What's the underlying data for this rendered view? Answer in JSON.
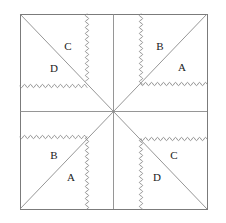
{
  "figure": {
    "canvas": {
      "width": 226,
      "height": 223,
      "background": "#ffffff"
    },
    "square": {
      "name": "outer-square",
      "left": 20,
      "top": 14,
      "right": 207,
      "bottom": 209,
      "stroke": "#7b7b7b",
      "stroke_width": 1
    },
    "center_point": {
      "x": 113.5,
      "y": 111.5
    },
    "straight_lines": [
      {
        "name": "diagonal-top-left-to-bottom-right",
        "x1": 20,
        "y1": 14,
        "x2": 207,
        "y2": 209,
        "stroke": "#8a8a8a"
      },
      {
        "name": "diagonal-bottom-left-to-top-right",
        "x1": 20,
        "y1": 209,
        "x2": 207,
        "y2": 14,
        "stroke": "#8a8a8a"
      },
      {
        "name": "vertical-median",
        "x1": 113.5,
        "y1": 14,
        "x2": 113.5,
        "y2": 209,
        "stroke": "#8a8a8a"
      },
      {
        "name": "horizontal-median",
        "x1": 20,
        "y1": 111.5,
        "x2": 207,
        "y2": 111.5,
        "stroke": "#8a8a8a"
      }
    ],
    "wavy_lines": [
      {
        "name": "wavy-vertical-top-left",
        "orientation": "vertical",
        "x1": 87,
        "y1": 14,
        "x2": 87,
        "y2": 81,
        "amplitude": 1.6,
        "wavelength": 6,
        "stroke": "#8a8a8a"
      },
      {
        "name": "wavy-horizontal-top-left",
        "orientation": "horizontal",
        "x1": 20,
        "y1": 86,
        "x2": 87,
        "y2": 86,
        "amplitude": 1.6,
        "wavelength": 6,
        "stroke": "#8a8a8a"
      },
      {
        "name": "wavy-vertical-top-right",
        "orientation": "vertical",
        "x1": 141,
        "y1": 14,
        "x2": 141,
        "y2": 84,
        "amplitude": 1.6,
        "wavelength": 6,
        "stroke": "#8a8a8a"
      },
      {
        "name": "wavy-horizontal-top-right",
        "orientation": "horizontal",
        "x1": 141,
        "y1": 84,
        "x2": 207,
        "y2": 84,
        "amplitude": 1.6,
        "wavelength": 6,
        "stroke": "#8a8a8a"
      },
      {
        "name": "wavy-horizontal-bottom-left",
        "orientation": "horizontal",
        "x1": 20,
        "y1": 137,
        "x2": 87,
        "y2": 137,
        "amplitude": 1.6,
        "wavelength": 6,
        "stroke": "#8a8a8a"
      },
      {
        "name": "wavy-vertical-bottom-left",
        "orientation": "vertical",
        "x1": 87,
        "y1": 137,
        "x2": 87,
        "y2": 209,
        "amplitude": 1.6,
        "wavelength": 6,
        "stroke": "#8a8a8a"
      },
      {
        "name": "wavy-horizontal-bottom-right",
        "orientation": "horizontal",
        "x1": 141,
        "y1": 139,
        "x2": 207,
        "y2": 139,
        "amplitude": 1.6,
        "wavelength": 6,
        "stroke": "#8a8a8a"
      },
      {
        "name": "wavy-vertical-bottom-right",
        "orientation": "vertical",
        "x1": 141,
        "y1": 139,
        "x2": 141,
        "y2": 209,
        "amplitude": 1.6,
        "wavelength": 6,
        "stroke": "#8a8a8a"
      }
    ],
    "labels": [
      {
        "name": "label-top-left-c",
        "text": "C",
        "x": 68,
        "y": 47,
        "quadrant": "top-left"
      },
      {
        "name": "label-top-left-d",
        "text": "D",
        "x": 54,
        "y": 69,
        "quadrant": "top-left"
      },
      {
        "name": "label-top-right-b",
        "text": "B",
        "x": 160,
        "y": 47,
        "quadrant": "top-right"
      },
      {
        "name": "label-top-right-a",
        "text": "A",
        "x": 182,
        "y": 68,
        "quadrant": "top-right"
      },
      {
        "name": "label-bottom-left-b",
        "text": "B",
        "x": 54,
        "y": 156,
        "quadrant": "bottom-left"
      },
      {
        "name": "label-bottom-left-a",
        "text": "A",
        "x": 71,
        "y": 178,
        "quadrant": "bottom-left"
      },
      {
        "name": "label-bottom-right-c",
        "text": "C",
        "x": 174,
        "y": 156,
        "quadrant": "bottom-right"
      },
      {
        "name": "label-bottom-right-d",
        "text": "D",
        "x": 157,
        "y": 178,
        "quadrant": "bottom-right"
      }
    ]
  }
}
